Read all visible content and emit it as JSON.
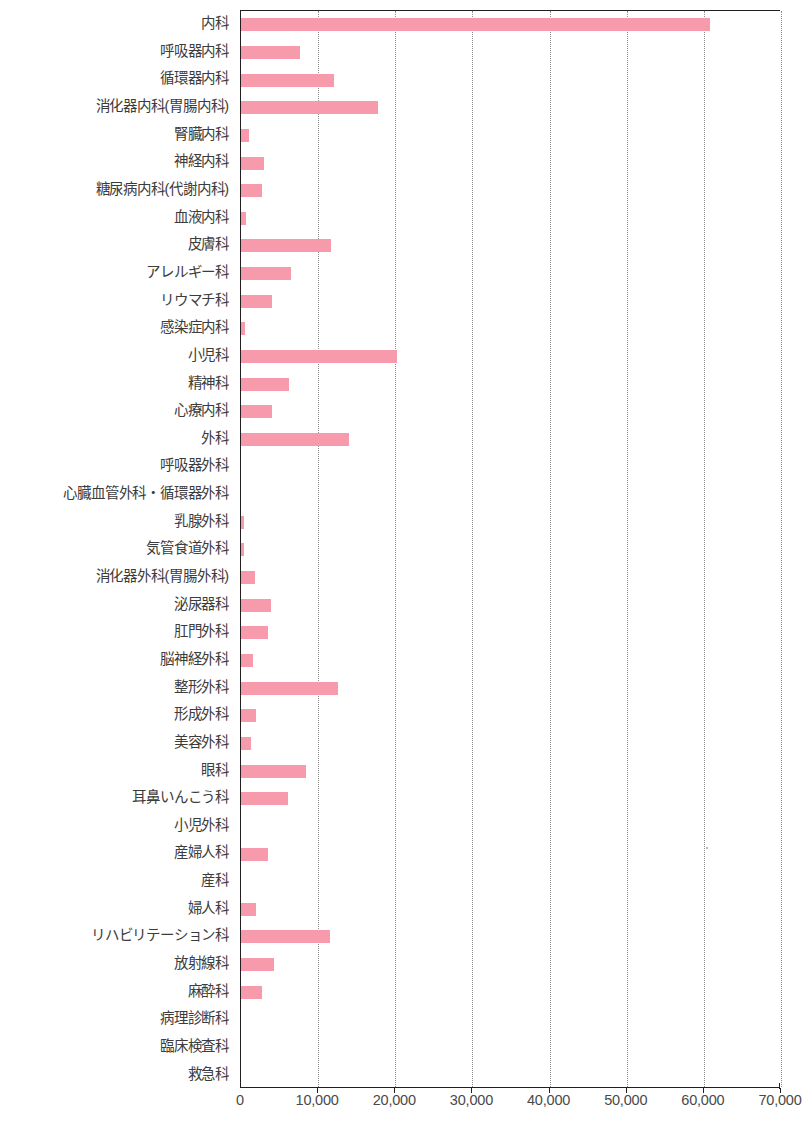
{
  "chart_data": {
    "type": "bar",
    "orientation": "horizontal",
    "title": "",
    "xlabel": "",
    "ylabel": "",
    "xlim": [
      0,
      70000
    ],
    "xticks": [
      "0",
      "10,000",
      "20,000",
      "30,000",
      "40,000",
      "50,000",
      "60,000",
      "70,000"
    ],
    "xtick_values": [
      0,
      10000,
      20000,
      30000,
      40000,
      50000,
      60000,
      70000
    ],
    "grid": "vertical-dotted",
    "legend": "none",
    "bar_color": "#f79aac",
    "categories": [
      "内科",
      "呼吸器内科",
      "循環器内科",
      "消化器内科(胃腸内科)",
      "腎臓内科",
      "神経内科",
      "糖尿病内科(代謝内科)",
      "血液内科",
      "皮膚科",
      "アレルギー科",
      "リウマチ科",
      "感染症内科",
      "小児科",
      "精神科",
      "心療内科",
      "外科",
      "呼吸器外科",
      "心臓血管外科・循環器外科",
      "乳腺外科",
      "気管食道外科",
      "消化器外科(胃腸外科)",
      "泌尿器科",
      "肛門外科",
      "脳神経外科",
      "整形外科",
      "形成外科",
      "美容外科",
      "眼科",
      "耳鼻いんこう科",
      "小児外科",
      "産婦人科",
      "産科",
      "婦人科",
      "リハビリテーション科",
      "放射線科",
      "麻酔科",
      "病理診断科",
      "臨床検査科",
      "救急科"
    ],
    "values": [
      60800,
      7600,
      12000,
      17800,
      1000,
      3000,
      2700,
      600,
      11700,
      6500,
      4000,
      500,
      20200,
      6200,
      4000,
      14000,
      0,
      0,
      400,
      400,
      1800,
      3900,
      3500,
      1600,
      12600,
      2000,
      1300,
      8400,
      6100,
      0,
      3500,
      0,
      2000,
      11500,
      4300,
      2700,
      0,
      0,
      0
    ]
  }
}
